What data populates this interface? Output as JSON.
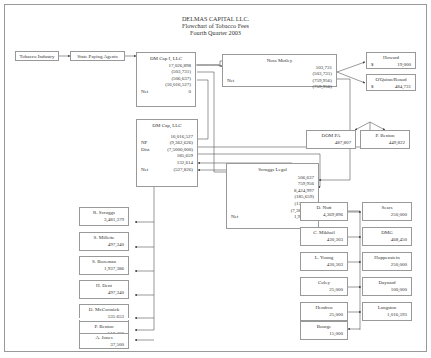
{
  "title": {
    "line1": "DELMAS CAPITAL LLC.",
    "line2": "Flowchart of Tobacco Fees",
    "line3": "Fourth Quarter 2003"
  },
  "flow_start": {
    "tobacco_industry": "Tobacco Industry",
    "state_paying_agents": "State Paying Agents"
  },
  "dm_cap_1": {
    "name": "DM Cap I, LLC",
    "values": [
      "17,026,898",
      "(503,731)",
      "(506,637)",
      "(16,016,527)"
    ],
    "net_label": "Net",
    "net_value": "0"
  },
  "noss_motley": {
    "name": "Noss Motley",
    "values": [
      "503,731",
      "(503,731)",
      "(759,956)"
    ],
    "net_label": "Net",
    "net_value": "(759,956)"
  },
  "howard": {
    "name": "Howard",
    "currency": "$",
    "value": "19,000"
  },
  "oquinn": {
    "name": "O'Quinn/Rosod",
    "currency": "$",
    "value": "484,731"
  },
  "dm_cap": {
    "name": "DM Cap, LLC",
    "rows": [
      {
        "label": "",
        "value": "16,016,527"
      },
      {
        "label": "NP",
        "value": "(9,362,626)"
      },
      {
        "label": "Dist",
        "value": "(7,5000,000)"
      },
      {
        "label": "",
        "value": "185,659"
      },
      {
        "label": "",
        "value": "132,614"
      },
      {
        "label": "Net",
        "value": "(527,826)"
      }
    ]
  },
  "dom_pa": {
    "name": "DOM PA",
    "value": "487,807"
  },
  "p_benton_top": {
    "name": "P. Benton",
    "value": "449,822"
  },
  "scruggs_legal": {
    "name": "Scruggs Legal",
    "values": [
      "506,637",
      "759,956",
      "8,424,997",
      "(185,659)",
      "(132,614)",
      "(7,380,545)"
    ],
    "net_label": "Net",
    "net_value": "1,992,772"
  },
  "left_recipients": [
    {
      "name": "R. Scruggs",
      "value": "3,481,379"
    },
    {
      "name": "S. Millette",
      "value": "497,340"
    },
    {
      "name": "S. Bozeman",
      "value": "1,937,386"
    },
    {
      "name": "H. Dent",
      "value": "497,340"
    },
    {
      "name": "D. McCormick",
      "value": "535,653"
    },
    {
      "name": "P. Benton",
      "value": "513,402"
    },
    {
      "name": "A. Jones",
      "value": "37,500"
    }
  ],
  "right_pairs": [
    {
      "left": {
        "name": "D. Nutt",
        "value": "4,369,896"
      },
      "right": {
        "name": "Sears",
        "value": "250,000"
      }
    },
    {
      "left": {
        "name": "C. Mikhail",
        "value": "430,303"
      },
      "right": {
        "name": "DMG",
        "value": "468,450"
      }
    },
    {
      "left": {
        "name": "L. Young",
        "value": "430,303"
      },
      "right": {
        "name": "Hoppenstein",
        "value": "250,000"
      }
    },
    {
      "left": {
        "name": "Coley",
        "value": "25,000"
      },
      "right": {
        "name": "Daynard",
        "value": "100,000"
      }
    },
    {
      "left": {
        "name": "Hendren",
        "value": "25,000"
      },
      "right": {
        "name": "Langston",
        "value": "1,016,593"
      }
    },
    {
      "left": {
        "name": "Bourge",
        "value": "15,000"
      },
      "right": null
    }
  ],
  "colors": {
    "line": "#555555",
    "border": "#999999",
    "text": "#333333"
  }
}
